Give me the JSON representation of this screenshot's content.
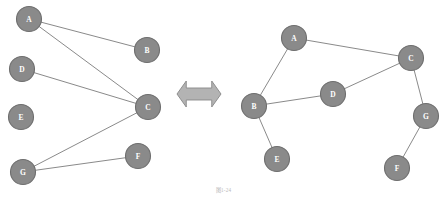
{
  "figure": {
    "caption": "图1-24",
    "width": 447,
    "height": 201,
    "background_color": "#ffffff"
  },
  "style": {
    "node_fill": "#8a8a8a",
    "node_stroke": "#6e6e6e",
    "node_radius": 12.5,
    "node_label_color": "#ffffff",
    "edge_color": "#8a8a8a",
    "arrow_fill": "#b3b3b3",
    "arrow_stroke": "#8f8f8f"
  },
  "connector": {
    "icon": "double-headed-horizontal-arrow",
    "center_x": 199,
    "center_y": 94,
    "width": 44,
    "height": 26
  },
  "graphs": [
    {
      "id": "left-graph",
      "name": "bipartite-layout-graph",
      "nodes": [
        {
          "id": "A",
          "label": "A",
          "x": 29,
          "y": 19
        },
        {
          "id": "B",
          "label": "B",
          "x": 147,
          "y": 50
        },
        {
          "id": "D",
          "label": "D",
          "x": 22,
          "y": 69
        },
        {
          "id": "C",
          "label": "C",
          "x": 148,
          "y": 107
        },
        {
          "id": "E",
          "label": "E",
          "x": 21,
          "y": 117
        },
        {
          "id": "F",
          "label": "F",
          "x": 138,
          "y": 156
        },
        {
          "id": "G",
          "label": "G",
          "x": 23,
          "y": 172
        }
      ],
      "edges": [
        {
          "from": "A",
          "to": "B"
        },
        {
          "from": "A",
          "to": "C"
        },
        {
          "from": "D",
          "to": "C"
        },
        {
          "from": "G",
          "to": "C"
        },
        {
          "from": "G",
          "to": "F"
        }
      ]
    },
    {
      "id": "right-graph",
      "name": "spring-layout-graph",
      "nodes": [
        {
          "id": "A",
          "label": "A",
          "x": 294,
          "y": 38
        },
        {
          "id": "C",
          "label": "C",
          "x": 411,
          "y": 58
        },
        {
          "id": "D",
          "label": "D",
          "x": 333,
          "y": 94
        },
        {
          "id": "B",
          "label": "B",
          "x": 254,
          "y": 106
        },
        {
          "id": "G",
          "label": "G",
          "x": 426,
          "y": 116
        },
        {
          "id": "E",
          "label": "E",
          "x": 277,
          "y": 159
        },
        {
          "id": "F",
          "label": "F",
          "x": 397,
          "y": 168
        }
      ],
      "edges": [
        {
          "from": "A",
          "to": "B"
        },
        {
          "from": "A",
          "to": "C"
        },
        {
          "from": "B",
          "to": "D"
        },
        {
          "from": "B",
          "to": "E"
        },
        {
          "from": "D",
          "to": "C"
        },
        {
          "from": "C",
          "to": "G"
        },
        {
          "from": "G",
          "to": "F"
        }
      ]
    }
  ]
}
